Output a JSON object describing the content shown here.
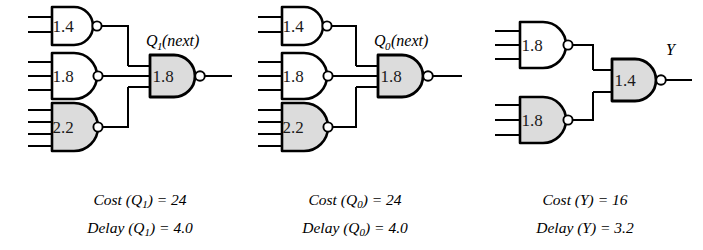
{
  "figure": {
    "background_color": "#ffffff",
    "line_color": "#000000",
    "gate_fill_white": "#ffffff",
    "gate_fill_gray": "#dcdcdc",
    "panel_count": 3
  },
  "panels": [
    {
      "id": "q1-next",
      "output_label_base": "Q",
      "output_label_sub": "1",
      "output_label_tail": "(next)",
      "gates": [
        {
          "name": "nand-1-4-top",
          "label": "1.4",
          "inputs": 2,
          "fill": "white"
        },
        {
          "name": "nand-1-8-mid",
          "label": "1.8",
          "inputs": 3,
          "fill": "white"
        },
        {
          "name": "nand-2-2-bottom",
          "label": "2.2",
          "inputs": 4,
          "fill": "gray"
        },
        {
          "name": "nand-1-8-output",
          "label": "1.8",
          "inputs": 3,
          "fill": "gray"
        }
      ],
      "caption": {
        "cost_prefix": "Cost (",
        "cost_var": "Q",
        "cost_var_sub": "1",
        "cost_suffix": ") = ",
        "cost_value": "24",
        "delay_prefix": "Delay (",
        "delay_var": "Q",
        "delay_var_sub": "1",
        "delay_suffix": ") = ",
        "delay_value": "4.0"
      }
    },
    {
      "id": "q0-next",
      "output_label_base": "Q",
      "output_label_sub": "0",
      "output_label_tail": "(next)",
      "gates": [
        {
          "name": "nand-1-4-top",
          "label": "1.4",
          "inputs": 2,
          "fill": "white"
        },
        {
          "name": "nand-1-8-mid",
          "label": "1.8",
          "inputs": 3,
          "fill": "white"
        },
        {
          "name": "nand-2-2-bottom",
          "label": "2.2",
          "inputs": 4,
          "fill": "gray"
        },
        {
          "name": "nand-1-8-output",
          "label": "1.8",
          "inputs": 3,
          "fill": "gray"
        }
      ],
      "caption": {
        "cost_prefix": "Cost (",
        "cost_var": "Q",
        "cost_var_sub": "0",
        "cost_suffix": ") = ",
        "cost_value": "24",
        "delay_prefix": "Delay (",
        "delay_var": "Q",
        "delay_var_sub": "0",
        "delay_suffix": ") = ",
        "delay_value": "4.0"
      }
    },
    {
      "id": "y-output",
      "output_label_base": "Y",
      "output_label_sub": "",
      "output_label_tail": "",
      "gates": [
        {
          "name": "nand-1-8-top",
          "label": "1.8",
          "inputs": 3,
          "fill": "white"
        },
        {
          "name": "nand-1-8-bottom",
          "label": "1.8",
          "inputs": 3,
          "fill": "gray"
        },
        {
          "name": "nand-1-4-output",
          "label": "1.4",
          "inputs": 2,
          "fill": "gray"
        }
      ],
      "caption": {
        "cost_prefix": "Cost (",
        "cost_var": "Y",
        "cost_var_sub": "",
        "cost_suffix": ") = ",
        "cost_value": "16",
        "delay_prefix": "Delay (",
        "delay_var": "Y",
        "delay_var_sub": "",
        "delay_suffix": ") = ",
        "delay_value": "3.2"
      }
    }
  ]
}
